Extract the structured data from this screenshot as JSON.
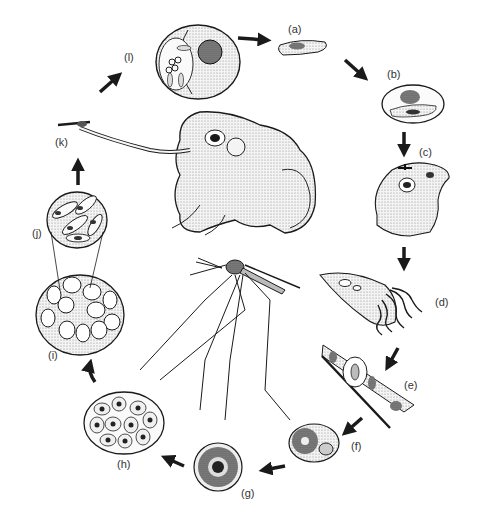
{
  "diagram": {
    "type": "life-cycle",
    "colors": {
      "ink": "#1a1a1a",
      "background": "#ffffff",
      "stipple": "#555555"
    },
    "central_figures": [
      {
        "name": "frog",
        "description": "Frog with extended tongue catching a mosquito"
      },
      {
        "name": "mosquito",
        "description": "Long-legged mosquito in side view"
      }
    ],
    "stages": [
      {
        "label": "(a)",
        "description": "Elongate parasite cell with dark nucleus"
      },
      {
        "label": "(b)",
        "description": "Parasite within host red blood cell"
      },
      {
        "label": "(c)",
        "description": "Mosquito biting a small frog"
      },
      {
        "label": "(d)",
        "description": "Mosquito gut with flagellated gametes (exflagellation)"
      },
      {
        "label": "(e)",
        "description": "Zygote in mosquito gut epithelium"
      },
      {
        "label": "(f)",
        "description": "Oocyst forming in gut wall"
      },
      {
        "label": "(g)",
        "description": "Mature oocyst"
      },
      {
        "label": "(h)",
        "description": "Oocyst with developing sporozoites"
      },
      {
        "label": "(i)",
        "description": "Oocyst packed with sporocysts"
      },
      {
        "label": "(j)",
        "description": "Enlarged sporocyst containing sporozoites"
      },
      {
        "label": "(k)",
        "description": "Frog tongue catching infected mosquito"
      },
      {
        "label": "(l)",
        "description": "Host cell with meront / merozoites"
      }
    ],
    "flow": [
      "(a)",
      "(b)",
      "(c)",
      "(d)",
      "(e)",
      "(f)",
      "(g)",
      "(h)",
      "(i)",
      "(j)",
      "(k)",
      "(l)",
      "(a)"
    ]
  },
  "labels": {
    "a": "(a)",
    "b": "(b)",
    "c": "(c)",
    "d": "(d)",
    "e": "(e)",
    "f": "(f)",
    "g": "(g)",
    "h": "(h)",
    "i": "(i)",
    "j": "(j)",
    "k": "(k)",
    "l": "(l)"
  }
}
